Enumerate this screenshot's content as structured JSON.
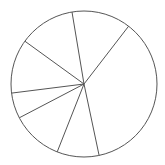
{
  "chart_data": {
    "type": "pie",
    "title": "",
    "labels": [
      "",
      "",
      "",
      "",
      "",
      "",
      ""
    ],
    "values": [
      36.2,
      13.1,
      12.4,
      12.0,
      5.7,
      11.4,
      9.3
    ],
    "start_angles_deg": [
      281.9,
      52.3,
      99.5,
      144.1,
      187.2,
      207.6,
      248.5
    ],
    "legend": [],
    "colors": {
      "fill": "#ffffff",
      "stroke": "#555555"
    },
    "center": [
      84,
      84
    ],
    "radius": 73
  }
}
